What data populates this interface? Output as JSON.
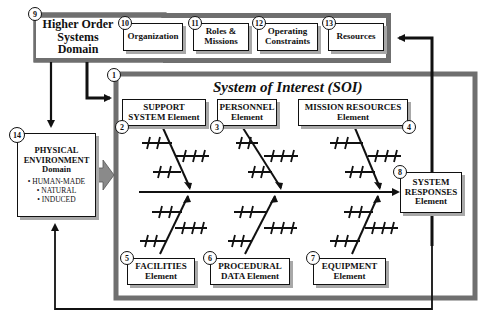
{
  "higher_order": {
    "number": "9",
    "title_line1": "Higher Order",
    "title_line2": "Systems",
    "title_line3": "Domain",
    "boxes": [
      {
        "number": "10",
        "line1": "Organization",
        "line2": ""
      },
      {
        "number": "11",
        "line1": "Roles &",
        "line2": "Missions"
      },
      {
        "number": "12",
        "line1": "Operating",
        "line2": "Constraints"
      },
      {
        "number": "13",
        "line1": "Resources",
        "line2": ""
      }
    ]
  },
  "soi": {
    "number": "1",
    "title": "System of Interest (SOI)",
    "top_elements": [
      {
        "number": "2",
        "line1": "SUPPORT",
        "line2": "SYSTEM Element"
      },
      {
        "number": "3",
        "line1": "PERSONNEL",
        "line2": "Element"
      },
      {
        "number": "4",
        "line1": "MISSION RESOURCES",
        "line2": "Element"
      }
    ],
    "bottom_elements": [
      {
        "number": "5",
        "line1": "FACILITIES",
        "line2": "Element"
      },
      {
        "number": "6",
        "line1": "PROCEDURAL",
        "line2": "DATA Element"
      },
      {
        "number": "7",
        "line1": "EQUIPMENT",
        "line2": "Element"
      }
    ],
    "response": {
      "number": "8",
      "line1": "SYSTEM",
      "line2": "RESPONSES",
      "line3": "Element"
    }
  },
  "environment": {
    "number": "14",
    "line1": "PHYSICAL",
    "line2": "ENVIRONMENT",
    "line3": "Domain",
    "items": [
      "• HUMAN-MADE",
      "• NATURAL",
      "• INDUCED"
    ]
  },
  "colors": {
    "frame_gray": "#6f6f6f",
    "shadow_gray": "#a8a8a8",
    "line": "#111111"
  }
}
